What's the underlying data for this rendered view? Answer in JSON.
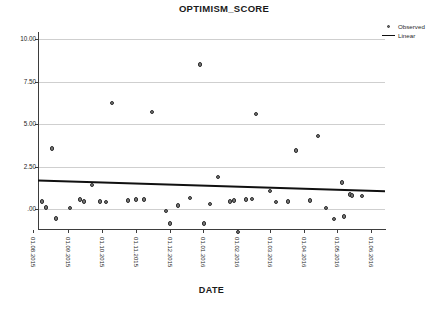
{
  "chart_data": {
    "type": "scatter",
    "title": "OPTIMISM_SCORE",
    "xlabel": "DATE",
    "ylabel": "",
    "ylim": [
      -1.5,
      10.6
    ],
    "yticks": [
      "10.00",
      "7.50",
      "5.00",
      "2.50",
      ".00"
    ],
    "ytick_values": [
      10.0,
      7.5,
      5.0,
      2.5,
      0.0
    ],
    "grid": "horizontal",
    "legend": {
      "position": "top-right",
      "entries": [
        {
          "label": "Observed",
          "marker": "circle",
          "color": "#6b6b6b"
        },
        {
          "label": "Linear",
          "marker": "line",
          "color": "#101010"
        }
      ]
    },
    "xticks": [
      "01.08.2015",
      "01.09.2015",
      "01.10.2015",
      "01.11.2015",
      "01.12.2015",
      "01.01.2016",
      "01.02.2016",
      "01.03.2016",
      "01.04.2016",
      "01.05.2016",
      "01.06.2016"
    ],
    "xtick_px": [
      33,
      68,
      102,
      136,
      170,
      203,
      237,
      270,
      304,
      337,
      371
    ],
    "series": [
      {
        "name": "Observed",
        "points": [
          {
            "x": 42,
            "y": 0.45
          },
          {
            "x": 46,
            "y": 0.1
          },
          {
            "x": 52,
            "y": 3.55
          },
          {
            "x": 56,
            "y": -0.55
          },
          {
            "x": 70,
            "y": 0.05
          },
          {
            "x": 80,
            "y": 0.55
          },
          {
            "x": 84,
            "y": 0.45
          },
          {
            "x": 92,
            "y": 1.4
          },
          {
            "x": 100,
            "y": 0.45
          },
          {
            "x": 106,
            "y": 0.4
          },
          {
            "x": 112,
            "y": 6.25
          },
          {
            "x": 128,
            "y": 0.5
          },
          {
            "x": 136,
            "y": 0.55
          },
          {
            "x": 144,
            "y": 0.55
          },
          {
            "x": 152,
            "y": 5.7
          },
          {
            "x": 166,
            "y": -0.1
          },
          {
            "x": 170,
            "y": -0.85
          },
          {
            "x": 178,
            "y": 0.2
          },
          {
            "x": 190,
            "y": 0.65
          },
          {
            "x": 200,
            "y": 8.5
          },
          {
            "x": 204,
            "y": -0.85
          },
          {
            "x": 210,
            "y": 0.3
          },
          {
            "x": 218,
            "y": 1.9
          },
          {
            "x": 230,
            "y": 0.45
          },
          {
            "x": 234,
            "y": 0.5
          },
          {
            "x": 238,
            "y": -1.35
          },
          {
            "x": 246,
            "y": 0.55
          },
          {
            "x": 252,
            "y": 0.6
          },
          {
            "x": 256,
            "y": 5.6
          },
          {
            "x": 270,
            "y": 1.05
          },
          {
            "x": 276,
            "y": 0.4
          },
          {
            "x": 288,
            "y": 0.45
          },
          {
            "x": 296,
            "y": 3.45
          },
          {
            "x": 310,
            "y": 0.5
          },
          {
            "x": 318,
            "y": 4.3
          },
          {
            "x": 326,
            "y": 0.05
          },
          {
            "x": 334,
            "y": -0.6
          },
          {
            "x": 342,
            "y": 1.55
          },
          {
            "x": 344,
            "y": -0.45
          },
          {
            "x": 350,
            "y": 0.85
          },
          {
            "x": 352,
            "y": 0.8
          },
          {
            "x": 362,
            "y": 0.75
          }
        ]
      }
    ],
    "fit_line": {
      "name": "Linear",
      "x_start_px": 38,
      "x_end_px": 385,
      "y_start": 1.67,
      "y_end": 1.05
    }
  }
}
